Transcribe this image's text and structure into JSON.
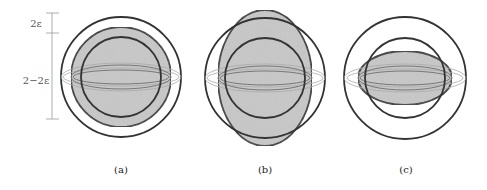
{
  "figure": {
    "scale_bar": {
      "top_label": "2ε",
      "bottom_label": "2−2ε"
    },
    "panels": [
      {
        "id": "a",
        "caption": "(a)",
        "shape": "sphere",
        "description": "filled sphere between two concentric circles"
      },
      {
        "id": "b",
        "caption": "(b)",
        "shape": "prolate-ellipsoid",
        "description": "vertically elongated filled ellipsoid crossing outer circle"
      },
      {
        "id": "c",
        "caption": "(c)",
        "shape": "oblate-ellipsoid",
        "description": "horizontally flattened filled ellipsoid inside inner circle"
      }
    ],
    "colors": {
      "stroke": "#333333",
      "fill": "#c8c8c8",
      "equator_light": "#aaaaaa",
      "equator_dark": "#777777",
      "scale": "#999999"
    }
  }
}
